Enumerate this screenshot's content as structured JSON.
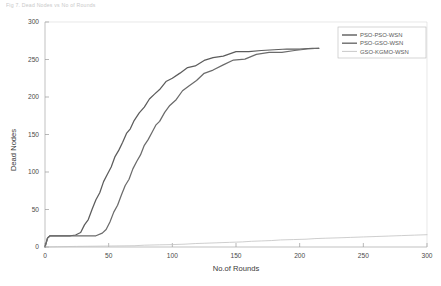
{
  "header": {
    "caption": "Fig 7. Dead Nodes vs No of Rounds"
  },
  "chart_data": {
    "type": "line",
    "title": "",
    "xlabel": "No.of Rounds",
    "ylabel": "Dead Nodes",
    "xlim": [
      0,
      300
    ],
    "ylim": [
      0,
      300
    ],
    "xticks": [
      0,
      50,
      100,
      150,
      200,
      250,
      300
    ],
    "yticks": [
      0,
      50,
      100,
      150,
      200,
      250,
      300
    ],
    "xtick_labels": [
      "0",
      "50",
      "100",
      "150",
      "200",
      "250",
      "300"
    ],
    "ytick_labels": [
      "0",
      "50",
      "100",
      "150",
      "200",
      "250",
      "300"
    ],
    "grid": false,
    "legend_position": "upper right",
    "series": [
      {
        "name": "PSO-PSO-WSN",
        "color": "#5c5c5c",
        "x": [
          0,
          1,
          2,
          4,
          8,
          14,
          20,
          24,
          28,
          31,
          34,
          37,
          40,
          43,
          46,
          49,
          52,
          55,
          58,
          61,
          64,
          67,
          70,
          74,
          78,
          82,
          86,
          90,
          95,
          100,
          106,
          112,
          118,
          125,
          132,
          140,
          150,
          160,
          170,
          180,
          190,
          200,
          210,
          215
        ],
        "y": [
          0,
          6,
          12,
          15,
          15,
          15,
          15,
          16,
          20,
          28,
          38,
          50,
          62,
          74,
          86,
          97,
          108,
          119,
          130,
          140,
          150,
          159,
          168,
          178,
          188,
          196,
          204,
          211,
          219,
          226,
          232,
          238,
          243,
          248,
          252,
          256,
          259,
          261,
          262,
          263,
          264,
          264,
          265,
          265
        ]
      },
      {
        "name": "PSO-GSO-WSN",
        "color": "#6b6b6b",
        "x": [
          0,
          1,
          2,
          4,
          10,
          20,
          30,
          40,
          45,
          48,
          51,
          54,
          57,
          60,
          63,
          66,
          69,
          72,
          75,
          78,
          81,
          84,
          87,
          90,
          94,
          98,
          103,
          108,
          113,
          119,
          125,
          132,
          140,
          148,
          157,
          166,
          176,
          186,
          196,
          206,
          215
        ],
        "y": [
          0,
          6,
          12,
          15,
          15,
          15,
          15,
          15,
          17,
          24,
          34,
          45,
          57,
          69,
          81,
          92,
          103,
          114,
          124,
          134,
          144,
          153,
          161,
          169,
          179,
          188,
          198,
          207,
          215,
          223,
          230,
          237,
          243,
          248,
          252,
          256,
          259,
          261,
          262,
          264,
          265
        ]
      },
      {
        "name": "GSO-KGMO-WSN",
        "color": "#c2c2c2",
        "x": [
          0,
          10,
          25,
          40,
          55,
          70,
          78,
          90,
          100,
          110,
          118,
          125,
          135,
          145,
          155,
          162,
          170,
          178,
          185,
          195,
          205,
          212,
          220,
          230,
          240,
          250,
          260,
          270,
          280,
          290,
          300
        ],
        "y": [
          0,
          0.4,
          0.8,
          1.1,
          1.4,
          1.7,
          2.4,
          2.9,
          3.2,
          3.8,
          4.6,
          5.0,
          5.6,
          6.2,
          6.8,
          7.6,
          8.1,
          8.6,
          9.4,
          9.9,
          10.4,
          11.2,
          11.7,
          12.2,
          12.8,
          13.4,
          14.0,
          14.6,
          15.2,
          15.8,
          16.4
        ]
      }
    ]
  },
  "legend": {
    "entries": [
      {
        "label": "PSO-PSO-WSN"
      },
      {
        "label": "PSO-GSO-WSN"
      },
      {
        "label": "GSO-KGMO-WSN"
      }
    ]
  },
  "colors": {
    "axis": "#9a9a9a",
    "text": "#4a4a4a",
    "background": "#ffffff",
    "series1": "#5c5c5c",
    "series2": "#6b6b6b",
    "series3": "#c2c2c2"
  }
}
